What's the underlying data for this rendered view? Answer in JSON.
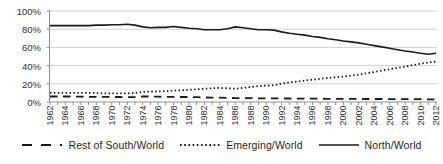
{
  "chart_data": {
    "type": "line",
    "title": "",
    "xlabel": "",
    "ylabel": "",
    "x_range": [
      1962,
      2012
    ],
    "x": [
      1962,
      1963,
      1964,
      1965,
      1966,
      1967,
      1968,
      1969,
      1970,
      1971,
      1972,
      1973,
      1974,
      1975,
      1976,
      1977,
      1978,
      1979,
      1980,
      1981,
      1982,
      1983,
      1984,
      1985,
      1986,
      1987,
      1988,
      1989,
      1990,
      1991,
      1992,
      1993,
      1994,
      1995,
      1996,
      1997,
      1998,
      1999,
      2000,
      2001,
      2002,
      2003,
      2004,
      2005,
      2006,
      2007,
      2008,
      2009,
      2010,
      2011,
      2012
    ],
    "x_tick_labels": [
      "1962",
      "1964",
      "1966",
      "1968",
      "1970",
      "1972",
      "1974",
      "1976",
      "1978",
      "1980",
      "1982",
      "1984",
      "1986",
      "1988",
      "1990",
      "1992",
      "1994",
      "1996",
      "1998",
      "2000",
      "2002",
      "2004",
      "2006",
      "2008",
      "2010",
      "2012"
    ],
    "ylim": [
      0,
      100
    ],
    "y_tick_labels": [
      "0%",
      "20%",
      "40%",
      "60%",
      "80%",
      "100%"
    ],
    "y_tick_values": [
      0,
      20,
      40,
      60,
      80,
      100
    ],
    "grid": "horizontal",
    "legend_position": "bottom",
    "series": [
      {
        "name": "Rest of South/World",
        "style": "dashed",
        "values": [
          6.0,
          6.0,
          6.0,
          6.0,
          5.8,
          5.7,
          5.7,
          5.6,
          5.5,
          5.5,
          5.4,
          5.5,
          6.0,
          6.0,
          5.8,
          5.7,
          5.6,
          5.5,
          5.5,
          5.3,
          5.0,
          4.8,
          4.7,
          4.5,
          4.3,
          4.2,
          4.2,
          4.1,
          4.0,
          4.0,
          3.9,
          3.8,
          3.7,
          3.7,
          3.6,
          3.6,
          3.5,
          3.5,
          3.4,
          3.4,
          3.4,
          3.3,
          3.3,
          3.3,
          3.2,
          3.2,
          3.2,
          3.1,
          3.1,
          3.0,
          3.0
        ]
      },
      {
        "name": "Emerging/World",
        "style": "dotted",
        "values": [
          10.0,
          10.0,
          10.0,
          10.0,
          10.0,
          10.0,
          10.0,
          9.5,
          9.5,
          9.5,
          9.5,
          10.0,
          11.0,
          11.5,
          11.5,
          12.0,
          12.5,
          13.0,
          13.5,
          14.0,
          14.5,
          15.0,
          15.5,
          15.0,
          14.5,
          15.5,
          16.5,
          17.5,
          18.0,
          18.5,
          20.0,
          21.5,
          22.5,
          23.5,
          24.5,
          25.5,
          26.5,
          27.0,
          28.0,
          29.0,
          30.0,
          31.5,
          33.0,
          34.5,
          36.0,
          37.5,
          39.0,
          40.5,
          42.0,
          43.5,
          44.5
        ]
      },
      {
        "name": "North/World",
        "style": "solid",
        "values": [
          84.0,
          84.0,
          84.0,
          84.0,
          84.0,
          84.0,
          84.5,
          84.5,
          85.0,
          85.0,
          85.5,
          84.5,
          82.5,
          81.5,
          82.0,
          82.0,
          83.0,
          82.0,
          81.0,
          80.5,
          79.5,
          79.5,
          79.5,
          80.5,
          82.5,
          81.5,
          80.5,
          79.5,
          79.5,
          79.0,
          77.0,
          75.5,
          74.5,
          73.5,
          72.0,
          71.0,
          69.5,
          68.5,
          67.0,
          66.0,
          65.0,
          63.5,
          62.0,
          60.5,
          59.0,
          57.5,
          56.0,
          55.0,
          53.5,
          52.5,
          53.5
        ]
      }
    ],
    "colors": {
      "line": "#1a1a1a",
      "gridline": "#d2d2d2",
      "axis": "#8f8f8f",
      "tick": "#8f8f8f",
      "tick_label_text": "#2e2e2e",
      "legend_text": "#1f1f1f",
      "background": "#ffffff"
    }
  }
}
